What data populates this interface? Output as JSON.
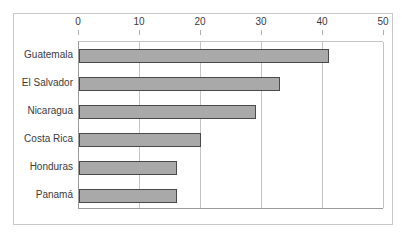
{
  "chart_data": {
    "type": "bar",
    "orientation": "horizontal",
    "title": "",
    "subtitle": "",
    "xlabel": "",
    "ylabel": "",
    "categories": [
      "Guatemala",
      "El Salvador",
      "Nicaragua",
      "Costa Rica",
      "Honduras",
      "Panamá"
    ],
    "values": [
      41,
      33,
      29,
      20,
      16,
      16
    ],
    "xlim": [
      0,
      50
    ],
    "xticks": [
      0,
      10,
      20,
      30,
      40,
      50
    ],
    "xtick_labels": [
      "0",
      "10",
      "20",
      "30",
      "40",
      "50"
    ],
    "grid": "vertical",
    "legend": "none",
    "series": [
      {
        "name": "",
        "values": [
          41,
          33,
          29,
          20,
          16,
          16
        ]
      }
    ],
    "colors": {
      "bar_fill": "#a9a9a9",
      "bar_border": "#4a4a4a",
      "gridline": "#c4c4c4",
      "axis": "#9a9a9a",
      "frame": "#c9c9c9",
      "text": "#3a3a3a",
      "background": "#ffffff"
    }
  }
}
